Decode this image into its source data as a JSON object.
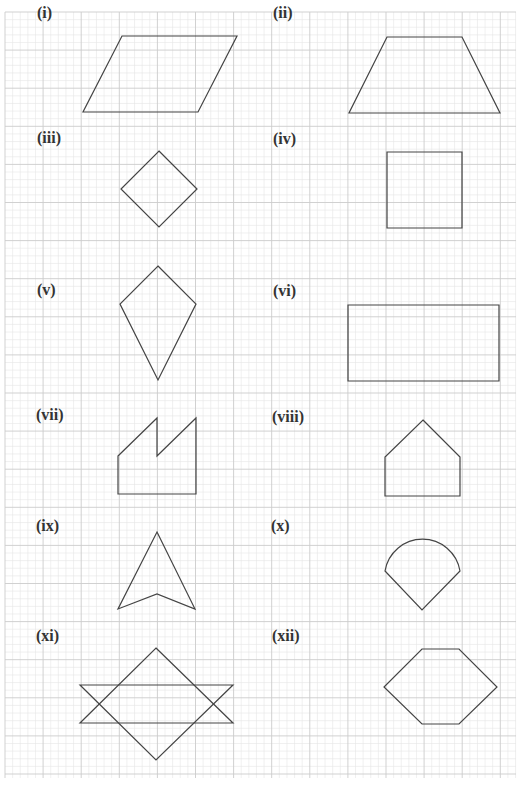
{
  "worksheet": {
    "background": "#ffffff",
    "grid": {
      "left": 5,
      "top": 12,
      "right": 516,
      "bottom": 778,
      "minor_step": 7.62,
      "major_every": 5,
      "minor_color": "#e6e6e6",
      "major_color": "#cccccc"
    },
    "stroke_color": "#444444",
    "shapes": [
      {
        "label": "(i)",
        "label_pos": [
          37,
          5
        ],
        "type": "polygon",
        "points": [
          [
            122,
            36
          ],
          [
            237,
            36
          ],
          [
            198,
            112
          ],
          [
            83,
            112
          ]
        ]
      },
      {
        "label": "(ii)",
        "label_pos": [
          273,
          5
        ],
        "type": "polygon",
        "points": [
          [
            387,
            37
          ],
          [
            462,
            37
          ],
          [
            500,
            113
          ],
          [
            349,
            113
          ]
        ]
      },
      {
        "label": "(iii)",
        "label_pos": [
          37,
          130
        ],
        "type": "polygon",
        "points": [
          [
            159,
            151
          ],
          [
            197,
            189
          ],
          [
            159,
            227
          ],
          [
            121,
            189
          ]
        ]
      },
      {
        "label": "(iv)",
        "label_pos": [
          273,
          131
        ],
        "type": "polygon",
        "points": [
          [
            387,
            152
          ],
          [
            462,
            152
          ],
          [
            462,
            228
          ],
          [
            387,
            228
          ]
        ]
      },
      {
        "label": "(v)",
        "label_pos": [
          37,
          282
        ],
        "type": "polygon",
        "points": [
          [
            158,
            266
          ],
          [
            196,
            304
          ],
          [
            158,
            380
          ],
          [
            120,
            304
          ]
        ]
      },
      {
        "label": "(vi)",
        "label_pos": [
          273,
          283
        ],
        "type": "polygon",
        "points": [
          [
            348,
            305
          ],
          [
            499,
            305
          ],
          [
            499,
            381
          ],
          [
            348,
            381
          ]
        ]
      },
      {
        "label": "(vii)",
        "label_pos": [
          36,
          407
        ],
        "type": "polygon",
        "points": [
          [
            118,
            456
          ],
          [
            157,
            418
          ],
          [
            157,
            456
          ],
          [
            196,
            418
          ],
          [
            196,
            494
          ],
          [
            118,
            494
          ]
        ]
      },
      {
        "label": "(viii)",
        "label_pos": [
          272,
          409
        ],
        "type": "polygon",
        "points": [
          [
            423,
            420
          ],
          [
            460,
            457
          ],
          [
            460,
            496
          ],
          [
            385,
            496
          ],
          [
            385,
            457
          ]
        ]
      },
      {
        "label": "(ix)",
        "label_pos": [
          36,
          518
        ],
        "type": "polygon",
        "points": [
          [
            157,
            532
          ],
          [
            195,
            609
          ],
          [
            157,
            594
          ],
          [
            118,
            609
          ]
        ]
      },
      {
        "label": "(x)",
        "label_pos": [
          271,
          518
        ],
        "type": "path",
        "d": "M385,571 A38,38 0 0 1 460,571 L422,610 Z"
      },
      {
        "label": "(xi)",
        "label_pos": [
          36,
          628
        ],
        "type": "polygons",
        "polys": [
          [
            [
              156,
              648
            ],
            [
              233,
              723
            ],
            [
              80,
              723
            ]
          ],
          [
            [
              80,
              685
            ],
            [
              233,
              685
            ],
            [
              156,
              760
            ]
          ]
        ]
      },
      {
        "label": "(xii)",
        "label_pos": [
          272,
          628
        ],
        "type": "polygon",
        "points": [
          [
            422,
            649
          ],
          [
            459,
            649
          ],
          [
            497,
            687
          ],
          [
            459,
            724
          ],
          [
            422,
            724
          ],
          [
            384,
            687
          ]
        ]
      }
    ]
  }
}
